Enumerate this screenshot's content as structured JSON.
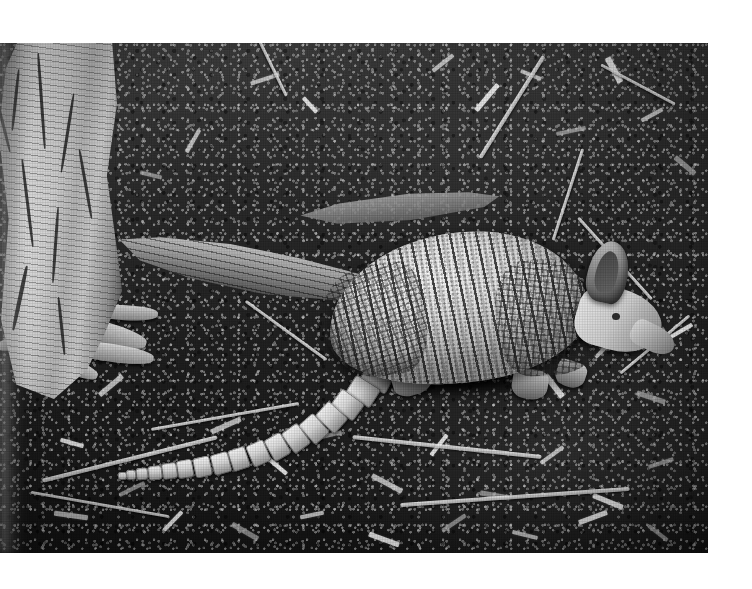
{
  "image": {
    "medium": "black-and-white photograph",
    "subject": "nine-banded armadillo",
    "scene": "forest floor with leaf litter",
    "orientation": "landscape",
    "border_color": "#ffffff",
    "plate": {
      "left": 0,
      "top": 43,
      "width": 708,
      "height": 510
    }
  },
  "palette": {
    "paper_white": "#fdfdfc",
    "litter_dark": "#232120",
    "litter_mid": "#46443e",
    "shell_light": "#f2efe6",
    "shell_mid": "#ded9cc",
    "shell_shadow": "#8d8778",
    "bark_light": "#e3ddcb",
    "bark_dark": "#3a3833",
    "band_dark": "#262320"
  },
  "subjects": {
    "armadillo": {
      "label": "nine-banded armadillo",
      "parts": [
        "carapace",
        "banded-shell",
        "pelvic-shield",
        "scapular-shield",
        "head",
        "ear",
        "snout",
        "eye",
        "legs",
        "ringed-tail"
      ],
      "band_count": 9,
      "facing": "right"
    },
    "tree_trunk": {
      "label": "tree trunk",
      "position": "left edge",
      "features": [
        "fissured bark",
        "exposed roots"
      ]
    },
    "fallen_branch": {
      "label": "fallen branch",
      "position": "mid-left, diagonal"
    },
    "ground": {
      "label": "leaf litter and twigs",
      "features": [
        "dry leaves",
        "pale twigs",
        "sticks",
        "dark humus"
      ]
    }
  },
  "caption": {
    "text": ""
  }
}
